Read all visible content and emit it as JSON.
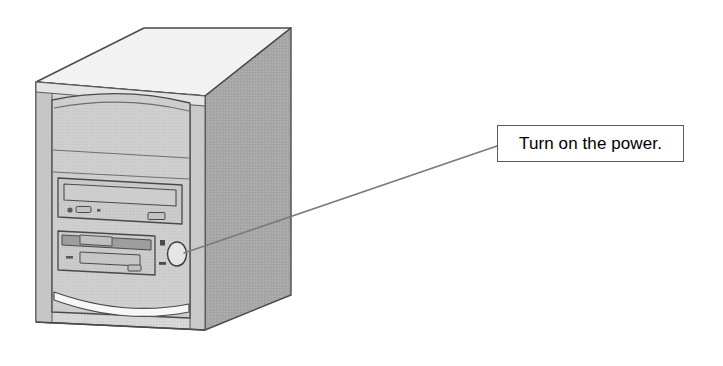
{
  "illustration": {
    "subject": "desktop-computer-tower",
    "view": "isometric-front-left",
    "style": "line-art-halftone"
  },
  "callout": {
    "text": "Turn on the power.",
    "target": "power-button",
    "box": {
      "x": 497,
      "y": 125,
      "width": 187,
      "height": 37
    },
    "leader_line": {
      "from_x": 497,
      "from_y": 146,
      "to_x": 180,
      "to_y": 255
    }
  },
  "colors": {
    "background": "#ffffff",
    "top_face": "#f0f0f0",
    "side_panel": "#a8a8a8",
    "front_panel": "#d6d6d6",
    "front_bezel": "#cfcfcf",
    "drive_face": "#d0d0d0",
    "edge_strip": "#c4c4c4",
    "outline": "#4a4a4a",
    "outline_light": "#6e6e6e",
    "accent_sweep": "#f7f7f7",
    "callout_border": "#5a5a5a",
    "callout_fill": "#ffffff",
    "text": "#000000",
    "leader_line": "#7a7a7a"
  },
  "tower": {
    "bays": [
      {
        "name": "blank-panel-upper",
        "label": ""
      },
      {
        "name": "blank-panel-lower",
        "label": ""
      },
      {
        "name": "optical-drive-bay",
        "label": ""
      },
      {
        "name": "floppy-drive-bay",
        "label": ""
      }
    ],
    "controls": [
      {
        "name": "power-button",
        "shape": "oval"
      },
      {
        "name": "power-led",
        "shape": "square"
      },
      {
        "name": "hdd-led",
        "shape": "dash"
      },
      {
        "name": "optical-eject-button",
        "shape": "rounded-rect"
      },
      {
        "name": "optical-activity-led",
        "shape": "circle"
      },
      {
        "name": "floppy-eject-button",
        "shape": "rect"
      }
    ]
  }
}
